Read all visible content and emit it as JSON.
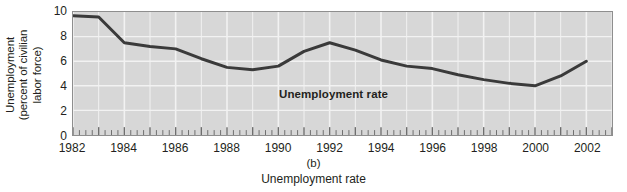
{
  "chart_data": {
    "type": "line",
    "title": "",
    "panel_label": "(b)",
    "xlabel": "Unemployment rate",
    "ylabel_lines": [
      "Unemployment",
      "(percent of civilian",
      "labor force)"
    ],
    "ylabel": "Unemployment (percent of civilian labor force)",
    "series_annotation": "Unemployment rate",
    "series": [
      {
        "name": "Unemployment rate",
        "color": "#3a3a3a",
        "x": [
          1982,
          1983,
          1984,
          1985,
          1986,
          1987,
          1988,
          1989,
          1990,
          1991,
          1992,
          1993,
          1994,
          1995,
          1996,
          1997,
          1998,
          1999,
          2000,
          2001,
          2002
        ],
        "values": [
          9.7,
          9.6,
          7.5,
          7.2,
          7.0,
          6.2,
          5.5,
          5.3,
          5.6,
          6.8,
          7.5,
          6.9,
          6.1,
          5.6,
          5.4,
          4.9,
          4.5,
          4.2,
          4.0,
          4.8,
          6.0
        ]
      }
    ],
    "xlim": [
      1982,
      2003
    ],
    "ylim": [
      0,
      10
    ],
    "y_ticks": [
      0,
      2,
      4,
      6,
      8,
      10
    ],
    "x_ticks": [
      1982,
      1984,
      1986,
      1988,
      1990,
      1992,
      1994,
      1996,
      1998,
      2000,
      2002
    ],
    "x_major_tick_step": 1,
    "x_minor_ticks_per_year": 4,
    "grid": true,
    "grid_color": "#f2f2f2",
    "plot_background": "#d7d7d7",
    "legend": "none"
  }
}
